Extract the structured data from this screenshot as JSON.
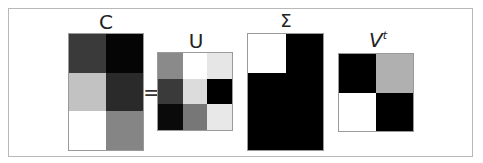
{
  "labels": {
    "c": "C",
    "equals": "=",
    "u": "U",
    "sigma": "Σ",
    "v": "V",
    "v_sup": "t"
  },
  "matrices": {
    "C": {
      "rows": 3,
      "cols": 2,
      "cells": [
        "#3a3a3a",
        "#050505",
        "#c2c2c2",
        "#2a2a2a",
        "#ffffff",
        "#858585"
      ]
    },
    "U": {
      "rows": 3,
      "cols": 3,
      "cells": [
        "#8a8a8a",
        "#ffffff",
        "#e6e6e6",
        "#3a3a3a",
        "#dcdcdc",
        "#000000",
        "#0a0a0a",
        "#777777",
        "#e8e8e8"
      ]
    },
    "Sigma": {
      "rows": 3,
      "cols": 2,
      "cells": [
        "#ffffff",
        "#000000",
        "#000000",
        "#000000",
        "#000000",
        "#000000"
      ]
    },
    "Vt": {
      "rows": 2,
      "cols": 2,
      "cells": [
        "#000000",
        "#b0b0b0",
        "#ffffff",
        "#000000"
      ]
    }
  }
}
